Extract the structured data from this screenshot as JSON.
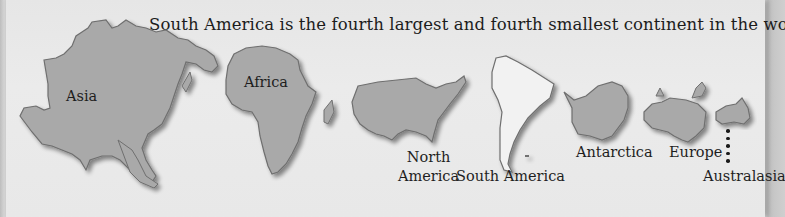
{
  "caption": "South America is the fourth largest and fourth smallest continent in the world.",
  "colors": {
    "continent_fill": "#a9a9a9",
    "highlight_fill": "#f2f2f2",
    "outline": "#6f6f6f",
    "panel_bg": "#e9e9e9",
    "text": "#1e1e1e"
  },
  "continents": [
    {
      "name": "Asia",
      "label": "Asia",
      "highlighted": false
    },
    {
      "name": "Africa",
      "label": "Africa",
      "highlighted": false
    },
    {
      "name": "North America",
      "label_line1": "North",
      "label_line2": "America",
      "highlighted": false
    },
    {
      "name": "South America",
      "label": "South America",
      "highlighted": true
    },
    {
      "name": "Antarctica",
      "label": "Antarctica",
      "highlighted": false
    },
    {
      "name": "Europe",
      "label": "Europe",
      "highlighted": false
    },
    {
      "name": "Australasia",
      "label": "Australasia",
      "highlighted": false
    }
  ]
}
